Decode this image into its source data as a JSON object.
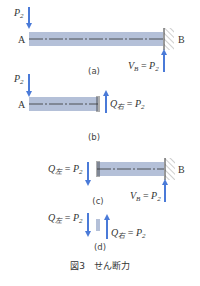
{
  "figure": {
    "caption": "図3　せん断力",
    "colors": {
      "beam_fill": "#b4c0d8",
      "beam_centerline": "#333333",
      "arrow": "#4a7ad8",
      "wall_hatch": "#888888",
      "text": "#333333"
    },
    "panels": [
      {
        "id": "a",
        "label": "(a)",
        "point_left": "A",
        "point_right": "B",
        "load": {
          "symbol": "P",
          "sub": "2",
          "direction": "down"
        },
        "reaction": {
          "symbol": "V",
          "sub": "B",
          "eq": " = ",
          "rhs": "P",
          "rhs_sub": "2",
          "direction": "up"
        },
        "support": "fixed-wall-right"
      },
      {
        "id": "b",
        "label": "(b)",
        "point_left": "A",
        "load": {
          "symbol": "P",
          "sub": "2",
          "direction": "down"
        },
        "shear": {
          "symbol": "Q",
          "sub": "右",
          "eq": " = ",
          "rhs": "P",
          "rhs_sub": "2",
          "direction": "up"
        }
      },
      {
        "id": "c",
        "label": "(c)",
        "point_right": "B",
        "shear": {
          "symbol": "Q",
          "sub": "左",
          "eq": " = ",
          "rhs": "P",
          "rhs_sub": "2",
          "direction": "down"
        },
        "reaction": {
          "symbol": "V",
          "sub": "B",
          "eq": " = ",
          "rhs": "P",
          "rhs_sub": "2",
          "direction": "up"
        },
        "support": "fixed-wall-right"
      },
      {
        "id": "d",
        "label": "(d)",
        "shear_left": {
          "symbol": "Q",
          "sub": "左",
          "eq": " = ",
          "rhs": "P",
          "rhs_sub": "2",
          "direction": "down"
        },
        "shear_right": {
          "symbol": "Q",
          "sub": "右",
          "eq": " = ",
          "rhs": "P",
          "rhs_sub": "2",
          "direction": "up"
        }
      }
    ]
  }
}
